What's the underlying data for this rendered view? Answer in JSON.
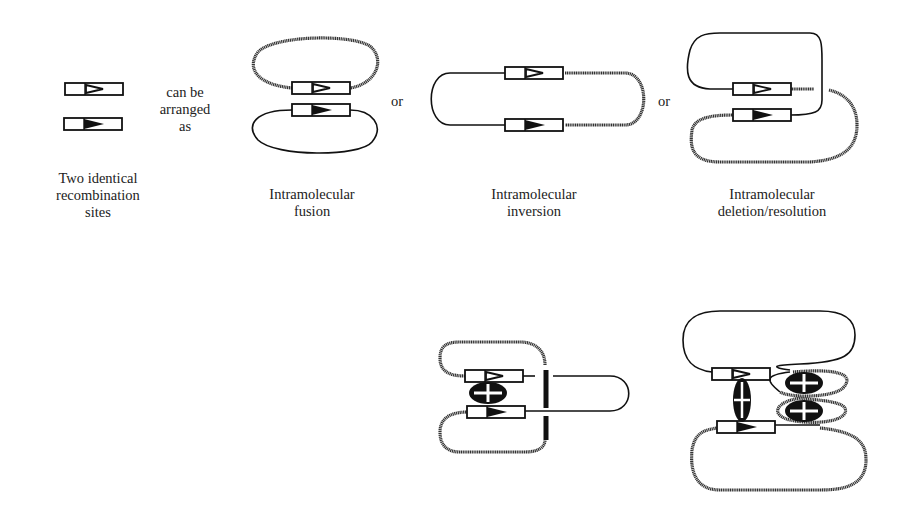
{
  "labels": {
    "sites": [
      "Two identical",
      "recombination",
      "sites"
    ],
    "arranged": [
      "can be",
      "arranged",
      "as"
    ],
    "or1": "or",
    "or2": "or",
    "fusion": [
      "Intramolecular",
      "fusion"
    ],
    "inversion": [
      "Intramolecular",
      "inversion"
    ],
    "deletion": [
      "Intramolecular",
      "deletion/resolution"
    ]
  },
  "legend": {
    "open_arrow": "open-triangle-site",
    "filled_arrow": "filled-triangle-site"
  },
  "colors": {
    "ink": "#111111",
    "thick_dna": "#333333",
    "background": "#ffffff"
  }
}
